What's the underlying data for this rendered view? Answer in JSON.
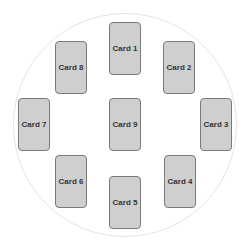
{
  "diagram": {
    "layout": "circular card spread",
    "colors": {
      "card_fill": "#cfcfcf",
      "card_border": "#7a7a7a",
      "circle_border": "#e4e4e4",
      "text": "#333333"
    },
    "cards": [
      {
        "label": "Card 1",
        "x": 109,
        "y": 22
      },
      {
        "label": "Card 2",
        "x": 163,
        "y": 41
      },
      {
        "label": "Card 3",
        "x": 200,
        "y": 98
      },
      {
        "label": "Card 4",
        "x": 164,
        "y": 155
      },
      {
        "label": "Card 5",
        "x": 109,
        "y": 176
      },
      {
        "label": "Card 6",
        "x": 55,
        "y": 155
      },
      {
        "label": "Card 7",
        "x": 18,
        "y": 98
      },
      {
        "label": "Card 8",
        "x": 55,
        "y": 41
      },
      {
        "label": "Card 9",
        "x": 109,
        "y": 98
      }
    ]
  }
}
